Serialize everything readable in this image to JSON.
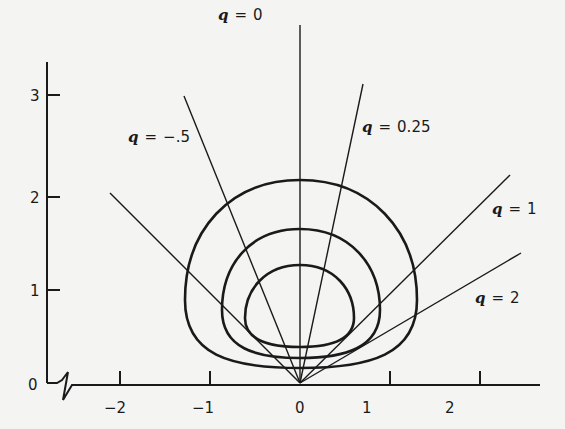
{
  "diagram": {
    "y_axis": {
      "ticks": [
        {
          "label": "0",
          "value": 0
        },
        {
          "label": "1",
          "value": 1
        },
        {
          "label": "2",
          "value": 2
        },
        {
          "label": "3",
          "value": 3
        }
      ]
    },
    "x_axis": {
      "ticks": [
        {
          "label": "−2",
          "value": -2
        },
        {
          "label": "−1",
          "value": -1
        },
        {
          "label": "0",
          "value": 0
        },
        {
          "label": "1",
          "value": 1
        },
        {
          "label": "2",
          "value": 2
        }
      ],
      "break_symbol": "axis-break"
    },
    "rays": [
      {
        "q_symbol": "q",
        "equals": "=",
        "value": "0"
      },
      {
        "q_symbol": "q",
        "equals": "=",
        "value": "0.25"
      },
      {
        "q_symbol": "q",
        "equals": "=",
        "value": "−.5"
      },
      {
        "q_symbol": "q",
        "equals": "=",
        "value": "1"
      },
      {
        "q_symbol": "q",
        "equals": "=",
        "value": "2"
      }
    ],
    "curves": [
      {
        "name": "outer",
        "top_y": 2.2
      },
      {
        "name": "middle",
        "top_y": 1.7
      },
      {
        "name": "inner",
        "top_y": 1.25
      }
    ],
    "colors": {
      "ink": "#1a1a1a",
      "paper": "#f4f4f2"
    }
  }
}
